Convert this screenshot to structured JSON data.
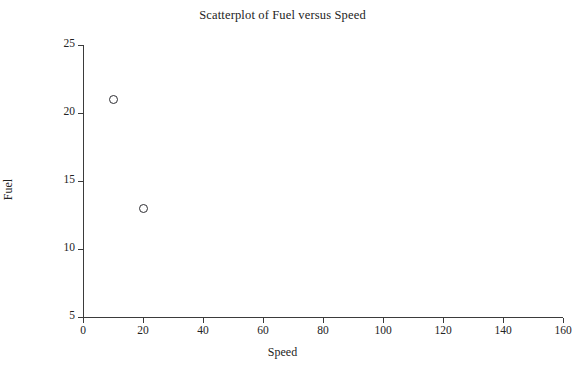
{
  "chart_data": {
    "type": "scatter",
    "title": "Scatterplot of Fuel versus Speed",
    "xlabel": "Speed",
    "ylabel": "Fuel",
    "xlim": [
      0,
      160
    ],
    "ylim": [
      5,
      25
    ],
    "xticks": [
      0,
      20,
      40,
      60,
      80,
      100,
      120,
      140,
      160
    ],
    "yticks": [
      5,
      10,
      15,
      20,
      25
    ],
    "grid": false,
    "legend": null,
    "marker_style": "open-circle",
    "marker_color": "#2e2e33",
    "background": "#ffffff",
    "axis_color": "#3b3b3b",
    "points": [
      {
        "x": 10,
        "y": 21
      },
      {
        "x": 20,
        "y": 13
      }
    ],
    "series": [
      {
        "name": "Fuel vs Speed",
        "x": [
          10,
          20
        ],
        "y": [
          21,
          13
        ]
      }
    ]
  }
}
